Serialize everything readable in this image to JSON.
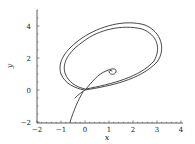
{
  "chart_data": {
    "type": "line",
    "title": "",
    "xlabel": "x",
    "ylabel": "y",
    "xlim": [
      -2,
      4
    ],
    "ylim": [
      -2,
      5
    ],
    "xticks": [
      -2,
      -1,
      0,
      1,
      2,
      3,
      4
    ],
    "yticks": [
      -2,
      0,
      2,
      4
    ],
    "xtick_labels": [
      "−2",
      "−1",
      "0",
      "1",
      "2",
      "3",
      "4"
    ],
    "ytick_labels": [
      "−2",
      "0",
      "2",
      "4"
    ],
    "grid": false,
    "legend": null,
    "series": [
      {
        "name": "trajectory",
        "color": "#333333",
        "description": "Phase-plane trajectory: enters from bottom near (-0.65,-2), passes through saddle near (0,0), winds twice around a large elliptical loop (x from about -1 to 3.1, y up to about 4.2), and ends in an inward spiral near (1.1, 1.2).",
        "points": [
          [
            -0.65,
            -2.0
          ],
          [
            -0.45,
            -1.0
          ],
          [
            -0.3,
            -0.4
          ],
          [
            -0.1,
            -0.05
          ],
          [
            0.0,
            0.0
          ],
          [
            0.5,
            0.1
          ],
          [
            1.5,
            0.4
          ],
          [
            2.5,
            1.1
          ],
          [
            3.05,
            2.2
          ],
          [
            3.0,
            3.3
          ],
          [
            2.2,
            4.15
          ],
          [
            1.0,
            4.0
          ],
          [
            0.0,
            3.4
          ],
          [
            -0.8,
            2.3
          ],
          [
            -1.0,
            1.2
          ],
          [
            -0.7,
            0.4
          ],
          [
            -0.15,
            0.05
          ],
          [
            0.0,
            0.0
          ],
          [
            0.6,
            0.15
          ],
          [
            1.6,
            0.55
          ],
          [
            2.6,
            1.3
          ],
          [
            2.95,
            2.3
          ],
          [
            2.8,
            3.2
          ],
          [
            2.0,
            3.9
          ],
          [
            0.9,
            3.75
          ],
          [
            0.0,
            3.2
          ],
          [
            -0.7,
            2.2
          ],
          [
            -0.85,
            1.2
          ],
          [
            -0.5,
            0.35
          ],
          [
            -0.05,
            0.0
          ],
          [
            0.3,
            0.4
          ],
          [
            0.7,
            1.0
          ],
          [
            1.1,
            1.3
          ],
          [
            1.25,
            1.2
          ],
          [
            1.1,
            1.05
          ],
          [
            0.95,
            1.15
          ],
          [
            1.05,
            1.2
          ]
        ]
      }
    ]
  },
  "axes": {
    "x_label": "x",
    "y_label": "y"
  }
}
